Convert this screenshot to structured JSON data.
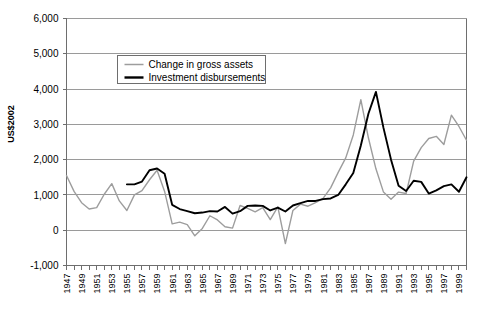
{
  "chart_data": {
    "type": "line",
    "title": "",
    "xlabel": "",
    "ylabel": "US$2002",
    "ylim": [
      -1000,
      6000
    ],
    "xlim": [
      1947,
      2000
    ],
    "grid": true,
    "legend_position": "top-left-inside",
    "y_ticks": [
      "6,000",
      "5,000",
      "4,000",
      "3,000",
      "2,000",
      "1,000",
      "0",
      "-1,000"
    ],
    "y_tick_values": [
      6000,
      5000,
      4000,
      3000,
      2000,
      1000,
      0,
      -1000
    ],
    "x_tick_labels": [
      "1947",
      "1949",
      "1951",
      "1953",
      "1955",
      "1957",
      "1959",
      "1961",
      "1963",
      "1965",
      "1967",
      "1969",
      "1971",
      "1973",
      "1975",
      "1977",
      "1979",
      "1981",
      "1983",
      "1985",
      "1987",
      "1989",
      "1991",
      "1993",
      "1995",
      "1997",
      "1999"
    ],
    "x": [
      1947,
      1948,
      1949,
      1950,
      1951,
      1952,
      1953,
      1954,
      1955,
      1956,
      1957,
      1958,
      1959,
      1960,
      1961,
      1962,
      1963,
      1964,
      1965,
      1966,
      1967,
      1968,
      1969,
      1970,
      1971,
      1972,
      1973,
      1974,
      1975,
      1976,
      1977,
      1978,
      1979,
      1980,
      1981,
      1982,
      1983,
      1984,
      1985,
      1986,
      1987,
      1988,
      1989,
      1990,
      1991,
      1992,
      1993,
      1994,
      1995,
      1996,
      1997,
      1998,
      1999,
      2000
    ],
    "series": [
      {
        "name": "Change in gross assets",
        "color": "#9d9d9d",
        "values": [
          1550,
          1100,
          780,
          600,
          640,
          1020,
          1320,
          830,
          560,
          1000,
          1120,
          1430,
          1700,
          1100,
          180,
          230,
          160,
          -160,
          50,
          410,
          290,
          100,
          60,
          700,
          620,
          520,
          640,
          300,
          660,
          -380,
          560,
          740,
          680,
          780,
          900,
          1200,
          1640,
          2050,
          2700,
          3700,
          2620,
          1740,
          1080,
          880,
          1080,
          1040,
          1960,
          2340,
          2600,
          2660,
          2430,
          3260,
          2940,
          2550
        ]
      },
      {
        "name": "Investment disbursements",
        "color": "#000000",
        "values": [
          null,
          null,
          null,
          null,
          null,
          null,
          null,
          null,
          1300,
          1300,
          1380,
          1700,
          1750,
          1600,
          720,
          600,
          540,
          480,
          500,
          540,
          530,
          660,
          470,
          540,
          690,
          700,
          690,
          560,
          640,
          530,
          700,
          770,
          830,
          830,
          880,
          900,
          1000,
          1300,
          1620,
          2400,
          3300,
          3920,
          2900,
          2000,
          1260,
          1110,
          1400,
          1370,
          1040,
          1130,
          1250,
          1300,
          1090,
          1500
        ]
      }
    ],
    "notes": {
      "disbursements_start_year": 1955,
      "peak_1982_disbursements": 3920,
      "peak_1998_disbursements": 5100,
      "trough_1976_gross_assets": -380
    }
  },
  "legend": {
    "items": [
      {
        "label": "Change in gross assets",
        "swatch": "gray-line-swatch"
      },
      {
        "label": "Investment disbursements",
        "swatch": "black-line-swatch"
      }
    ]
  },
  "axis": {
    "y_axis_title": "US$2002"
  }
}
